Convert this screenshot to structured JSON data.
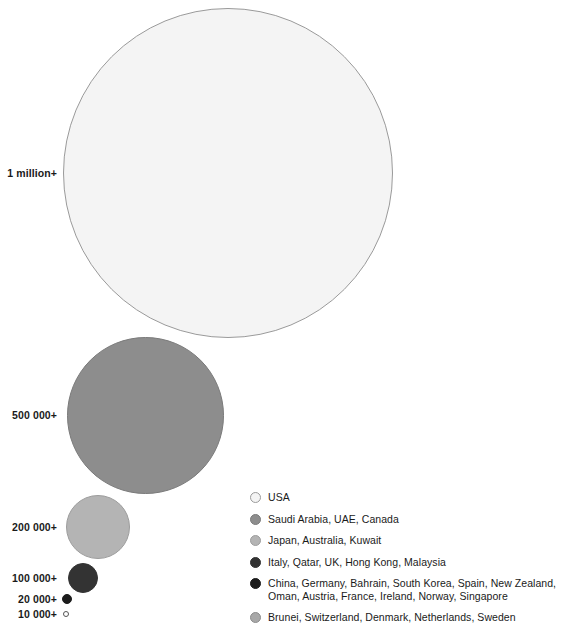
{
  "chart_data": {
    "type": "bubble",
    "title": "",
    "subtitle": "",
    "xlabel": "",
    "ylabel": "",
    "grid": false,
    "legend_position": "bottom-right",
    "tiers": [
      {
        "label": "1 million+",
        "value": 1000000,
        "diameter_px": 330,
        "center_x": 228,
        "center_y": 173,
        "fill": "#f4f4f4",
        "stroke": "#9a9a9a",
        "label_x_right": 57,
        "label_y": 173,
        "countries": [
          "USA"
        ]
      },
      {
        "label": "500 000+",
        "value": 500000,
        "diameter_px": 157,
        "center_x": 145,
        "center_y": 415,
        "fill": "#8d8d8d",
        "stroke": "#7a7a7a",
        "label_x_right": 57,
        "label_y": 415,
        "countries": [
          "Saudi Arabia",
          "UAE",
          "Canada"
        ]
      },
      {
        "label": "200 000+",
        "value": 200000,
        "diameter_px": 64,
        "center_x": 98,
        "center_y": 527,
        "fill": "#b4b4b4",
        "stroke": "#9d9d9d",
        "label_x_right": 57,
        "label_y": 527,
        "countries": [
          "Japan",
          "Australia",
          "Kuwait"
        ]
      },
      {
        "label": "100 000+",
        "value": 100000,
        "diameter_px": 30,
        "center_x": 83,
        "center_y": 578,
        "fill": "#333333",
        "stroke": "#333333",
        "label_x_right": 57,
        "label_y": 578,
        "countries": [
          "Italy",
          "Qatar",
          "UK",
          "Hong Kong",
          "Malaysia"
        ]
      },
      {
        "label": "20 000+",
        "value": 20000,
        "diameter_px": 10,
        "center_x": 67,
        "center_y": 599,
        "fill": "#1c1c1c",
        "stroke": "#1c1c1c",
        "label_x_right": 57,
        "label_y": 599,
        "countries": [
          "China",
          "Germany",
          "Bahrain",
          "South Korea",
          "Spain",
          "New Zealand",
          "Oman",
          "Austria",
          "France",
          "Ireland",
          "Norway",
          "Singapore"
        ]
      },
      {
        "label": "10 000+",
        "value": 10000,
        "diameter_px": 6,
        "center_x": 66,
        "center_y": 614,
        "fill": "#ffffff",
        "stroke": "#555555",
        "label_x_right": 57,
        "label_y": 614,
        "countries": [
          "Brunei",
          "Switzerland",
          "Denmark",
          "Netherlands",
          "Sweden"
        ]
      }
    ],
    "legend": [
      {
        "label": "USA",
        "fill": "#f4f4f4",
        "stroke": "#9a9a9a"
      },
      {
        "label": "Saudi Arabia, UAE, Canada",
        "fill": "#8d8d8d",
        "stroke": "#7a7a7a"
      },
      {
        "label": "Japan, Australia, Kuwait",
        "fill": "#b4b4b4",
        "stroke": "#9d9d9d"
      },
      {
        "label": "Italy, Qatar, UK, Hong Kong, Malaysia",
        "fill": "#333333",
        "stroke": "#333333"
      },
      {
        "label": "China, Germany, Bahrain, South Korea, Spain, New Zealand, Oman, Austria, France, Ireland, Norway, Singapore",
        "fill": "#1c1c1c",
        "stroke": "#1c1c1c"
      },
      {
        "label": "Brunei, Switzerland, Denmark, Netherlands, Sweden",
        "fill": "#a8a8a8",
        "stroke": "#8c8c8c"
      }
    ]
  }
}
